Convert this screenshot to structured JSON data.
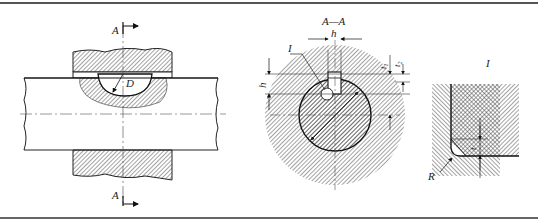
{
  "drawing": {
    "main_view": {
      "section_label_top": "A",
      "section_label_bottom": "A",
      "diameter_label": "D"
    },
    "section_view": {
      "title": "A—A",
      "width_label": "h",
      "height_label": "h",
      "detail_label": "I",
      "depth_label_1": "t",
      "depth_sub_1": "1",
      "depth_label_2": "t",
      "depth_sub_2": "2"
    },
    "detail_view": {
      "title": "I",
      "radius_label": "R",
      "gap_label": "t"
    }
  }
}
